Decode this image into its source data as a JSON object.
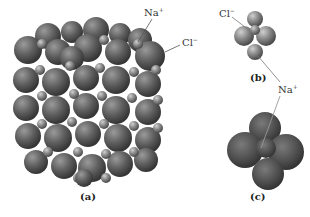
{
  "figure": {
    "panels": [
      {
        "id": "a",
        "caption": "(a)",
        "description": "Cubic NaCl lattice of packed spheres"
      },
      {
        "id": "b",
        "caption": "(b)",
        "description": "Na+ ion octahedrally coordinated by Cl- ions"
      },
      {
        "id": "c",
        "caption": "(c)",
        "description": "Cl- ion surrounded by Na+ ions (large spheres)"
      }
    ],
    "labels": {
      "a_na": {
        "base": "Na",
        "charge": "+"
      },
      "a_cl": {
        "base": "Cl",
        "charge": "−"
      },
      "b_cl": {
        "base": "Cl",
        "charge": "−"
      },
      "bc_na": {
        "base": "Na",
        "charge": "+"
      }
    },
    "colors": {
      "sphere_dark": "#4a4a4a",
      "sphere_mid": "#6e6e6e",
      "sphere_light": "#a8a8a8",
      "leader_line": "#555555",
      "background": "#ffffff"
    }
  }
}
